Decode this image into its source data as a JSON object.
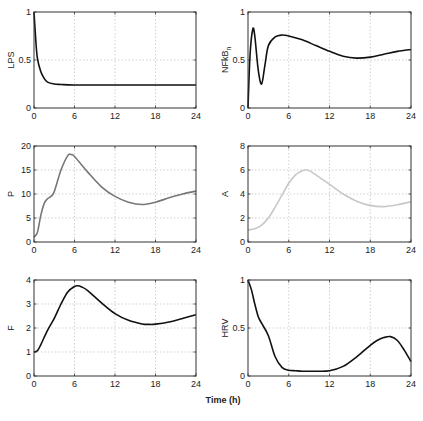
{
  "figure": {
    "xlabel": "Time (h)",
    "x_ticks": [
      "0",
      "6",
      "12",
      "18",
      "24"
    ]
  },
  "panels": [
    {
      "id": "lps",
      "ylabel": "LPS",
      "y_ticks": [
        "0",
        "0.5",
        "1"
      ],
      "color": "#111111"
    },
    {
      "id": "nfkbn",
      "ylabel": "NFkB",
      "ylabel_sub": "n",
      "y_ticks": [
        "0",
        "0.5",
        "1"
      ],
      "color": "#111111"
    },
    {
      "id": "p",
      "ylabel": "P",
      "y_ticks": [
        "0",
        "5",
        "10",
        "15",
        "20"
      ],
      "color": "#777777"
    },
    {
      "id": "a",
      "ylabel": "A",
      "y_ticks": [
        "0",
        "2",
        "4",
        "6",
        "8"
      ],
      "color": "#c8c8c8"
    },
    {
      "id": "f",
      "ylabel": "F",
      "y_ticks": [
        "0",
        "1",
        "2",
        "3",
        "4"
      ],
      "color": "#111111"
    },
    {
      "id": "hrv",
      "ylabel": "HRV",
      "y_ticks": [
        "0",
        "0.5",
        "1"
      ],
      "color": "#111111"
    }
  ],
  "chart_data": [
    {
      "type": "line",
      "title": "",
      "xlabel": "Time (h)",
      "ylabel": "LPS",
      "xlim": [
        0,
        24
      ],
      "ylim": [
        0,
        1
      ],
      "grid": true,
      "x": [
        0,
        0.25,
        0.5,
        1,
        1.5,
        2,
        3,
        4,
        6,
        12,
        18,
        24
      ],
      "values": [
        1.0,
        0.72,
        0.52,
        0.38,
        0.31,
        0.27,
        0.25,
        0.245,
        0.24,
        0.24,
        0.24,
        0.24
      ]
    },
    {
      "type": "line",
      "title": "",
      "xlabel": "Time (h)",
      "ylabel": "NFkB_n",
      "xlim": [
        0,
        24
      ],
      "ylim": [
        0,
        1
      ],
      "grid": true,
      "x": [
        0,
        0.3,
        0.7,
        1.0,
        1.5,
        2.0,
        2.5,
        3,
        4,
        5,
        6,
        8,
        10,
        12,
        14,
        16,
        18,
        20,
        22,
        24
      ],
      "values": [
        0.0,
        0.55,
        0.82,
        0.75,
        0.4,
        0.25,
        0.45,
        0.65,
        0.74,
        0.76,
        0.75,
        0.71,
        0.65,
        0.59,
        0.54,
        0.52,
        0.53,
        0.56,
        0.59,
        0.61
      ]
    },
    {
      "type": "line",
      "title": "",
      "xlabel": "Time (h)",
      "ylabel": "P",
      "xlim": [
        0,
        24
      ],
      "ylim": [
        0,
        20
      ],
      "grid": true,
      "x": [
        0,
        0.5,
        1,
        1.5,
        2,
        2.5,
        3,
        4,
        5,
        5.5,
        6,
        8,
        10,
        12,
        14,
        16,
        18,
        20,
        22,
        24
      ],
      "values": [
        1,
        2,
        5.5,
        8,
        9,
        9.5,
        10.5,
        15,
        18,
        18.2,
        17.8,
        14.5,
        11.5,
        9.5,
        8.3,
        7.8,
        8.3,
        9.2,
        10.0,
        10.6
      ]
    },
    {
      "type": "line",
      "title": "",
      "xlabel": "Time (h)",
      "ylabel": "A",
      "xlim": [
        0,
        24
      ],
      "ylim": [
        0,
        8
      ],
      "grid": true,
      "x": [
        0,
        1,
        2,
        3,
        4,
        5,
        6,
        7,
        8,
        8.5,
        9,
        10,
        12,
        14,
        16,
        18,
        20,
        22,
        24
      ],
      "values": [
        1.0,
        1.1,
        1.4,
        2.0,
        2.9,
        3.9,
        4.9,
        5.6,
        5.95,
        6.0,
        5.95,
        5.6,
        4.8,
        4.0,
        3.4,
        3.05,
        2.95,
        3.1,
        3.35
      ]
    },
    {
      "type": "line",
      "title": "",
      "xlabel": "Time (h)",
      "ylabel": "F",
      "xlim": [
        0,
        24
      ],
      "ylim": [
        0,
        4
      ],
      "grid": true,
      "x": [
        0,
        0.5,
        1,
        2,
        3,
        4,
        5,
        6,
        6.5,
        7,
        8,
        10,
        12,
        14,
        16,
        17,
        18,
        20,
        22,
        24
      ],
      "values": [
        1.0,
        1.05,
        1.3,
        1.9,
        2.4,
        3.0,
        3.5,
        3.73,
        3.76,
        3.72,
        3.55,
        3.05,
        2.6,
        2.32,
        2.17,
        2.15,
        2.16,
        2.25,
        2.4,
        2.55
      ]
    },
    {
      "type": "line",
      "title": "",
      "xlabel": "Time (h)",
      "ylabel": "HRV",
      "xlim": [
        0,
        24
      ],
      "ylim": [
        0,
        1
      ],
      "grid": true,
      "x": [
        0,
        0.5,
        1,
        1.5,
        2,
        3,
        4,
        5,
        6,
        7,
        8,
        10,
        12,
        14,
        16,
        18,
        19,
        20,
        21,
        22,
        23,
        24
      ],
      "values": [
        1.0,
        0.9,
        0.75,
        0.62,
        0.55,
        0.42,
        0.2,
        0.09,
        0.06,
        0.055,
        0.05,
        0.05,
        0.055,
        0.1,
        0.2,
        0.32,
        0.37,
        0.4,
        0.41,
        0.37,
        0.27,
        0.15
      ]
    }
  ]
}
